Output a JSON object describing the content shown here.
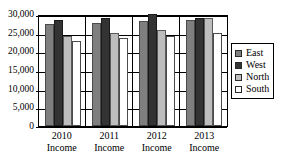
{
  "chart_data": {
    "type": "bar",
    "title": "",
    "subtitle": "",
    "xlabel": "",
    "ylabel": "",
    "categories": [
      "2010 Income",
      "2011 Income",
      "2012 Income",
      "2013 Income"
    ],
    "category_lines": [
      {
        "line1": "2010",
        "line2": "Income"
      },
      {
        "line1": "2011",
        "line2": "Income"
      },
      {
        "line1": "2012",
        "line2": "Income"
      },
      {
        "line1": "2013",
        "line2": "Income"
      }
    ],
    "series": [
      {
        "name": "East",
        "color": "#7f7f7f",
        "values": [
          27200,
          27500,
          28000,
          28300
        ]
      },
      {
        "name": "West",
        "color": "#333333",
        "values": [
          28500,
          29000,
          30000,
          28900
        ]
      },
      {
        "name": "North",
        "color": "#bdbdbd",
        "values": [
          24100,
          24900,
          25800,
          28800
        ]
      },
      {
        "name": "South",
        "color": "#ffffff",
        "values": [
          22800,
          23600,
          24100,
          24900
        ]
      }
    ],
    "ylim": [
      0,
      30000
    ],
    "ytick_values": [
      0,
      5000,
      10000,
      15000,
      20000,
      25000,
      30000
    ],
    "ytick_labels": [
      "0",
      "5,000",
      "10,000",
      "15,000",
      "20,000",
      "25,000",
      "30,000"
    ],
    "grid": true,
    "grid_axis": "y",
    "legend_position": "right",
    "legend_entries": [
      "East",
      "West",
      "North",
      "South"
    ]
  }
}
